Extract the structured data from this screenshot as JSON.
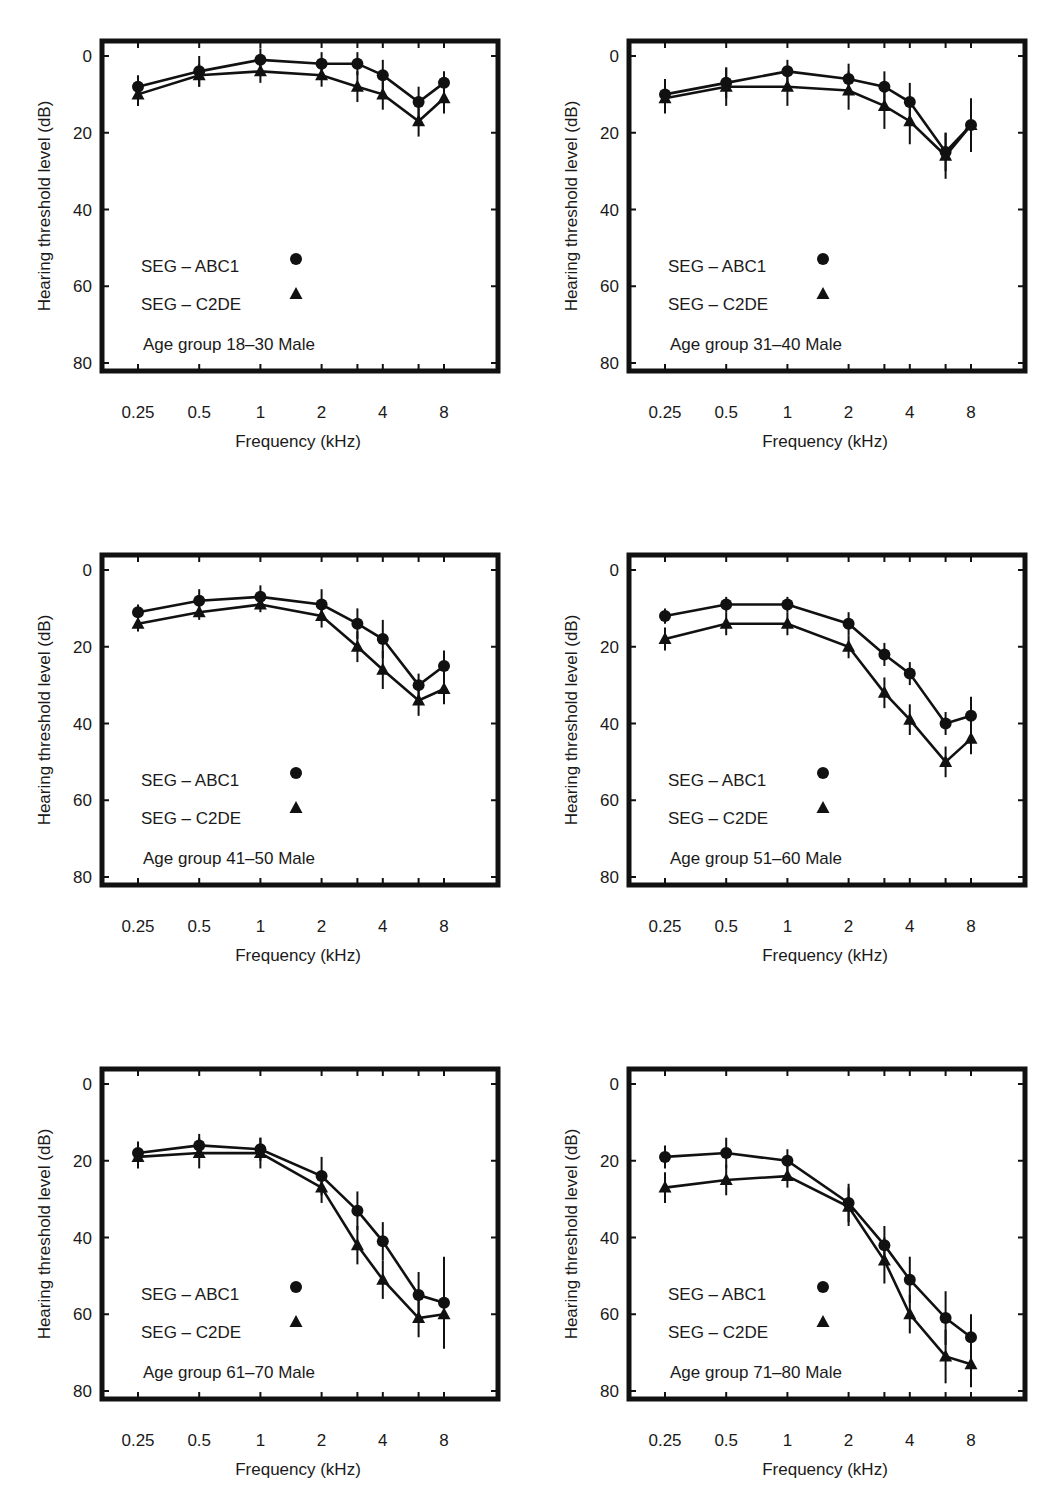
{
  "figure": {
    "layout": {
      "columns": 2,
      "rows": 3
    },
    "common": {
      "ylabel": "Hearing threshold level (dB)",
      "xlabel": "Frequency (kHz)",
      "y_ticks": [
        "0",
        "20",
        "40",
        "60",
        "80"
      ],
      "x_ticks": [
        "0.25",
        "0.5",
        "1",
        "2",
        "4",
        "8"
      ],
      "legend": [
        {
          "label": "SEG – ABC1",
          "marker": "circle"
        },
        {
          "label": "SEG – C2DE",
          "marker": "triangle"
        }
      ]
    }
  },
  "chart_data": [
    {
      "type": "line",
      "title": "Age group 18–30 Male",
      "xlabel": "Frequency (kHz)",
      "ylabel": "Hearing threshold level (dB)",
      "x": [
        0.25,
        0.5,
        1,
        2,
        3,
        4,
        6,
        8
      ],
      "x_tick_labels": [
        "0.25",
        "0.5",
        "1",
        "2",
        "4",
        "8"
      ],
      "ylim": [
        80,
        0
      ],
      "y_inverted": true,
      "series": [
        {
          "name": "SEG – ABC1",
          "marker": "circle",
          "values": [
            8,
            4,
            1,
            2,
            2,
            5,
            12,
            7
          ],
          "err": [
            3,
            4,
            3,
            3,
            3,
            4,
            4,
            3
          ]
        },
        {
          "name": "SEG – C2DE",
          "marker": "triangle",
          "values": [
            10,
            5,
            4,
            5,
            8,
            10,
            17,
            11
          ],
          "err": [
            3,
            3,
            3,
            3,
            4,
            4,
            4,
            4
          ]
        }
      ],
      "legend_position": "lower left",
      "grid": false
    },
    {
      "type": "line",
      "title": "Age group 31–40 Male",
      "xlabel": "Frequency (kHz)",
      "ylabel": "Hearing threshold level (dB)",
      "x": [
        0.25,
        0.5,
        1,
        2,
        3,
        4,
        6,
        8
      ],
      "x_tick_labels": [
        "0.25",
        "0.5",
        "1",
        "2",
        "4",
        "8"
      ],
      "ylim": [
        80,
        0
      ],
      "y_inverted": true,
      "series": [
        {
          "name": "SEG – ABC1",
          "marker": "circle",
          "values": [
            10,
            7,
            4,
            6,
            8,
            12,
            25,
            18
          ],
          "err": [
            4,
            4,
            3,
            4,
            4,
            5,
            5,
            7
          ]
        },
        {
          "name": "SEG – C2DE",
          "marker": "triangle",
          "values": [
            11,
            8,
            8,
            9,
            13,
            17,
            26,
            18
          ],
          "err": [
            4,
            5,
            5,
            5,
            6,
            6,
            6,
            6
          ]
        }
      ],
      "legend_position": "lower left",
      "grid": false
    },
    {
      "type": "line",
      "title": "Age group 41–50 Male",
      "xlabel": "Frequency (kHz)",
      "ylabel": "Hearing threshold level (dB)",
      "x": [
        0.25,
        0.5,
        1,
        2,
        3,
        4,
        6,
        8
      ],
      "x_tick_labels": [
        "0.25",
        "0.5",
        "1",
        "2",
        "4",
        "8"
      ],
      "ylim": [
        80,
        0
      ],
      "y_inverted": true,
      "series": [
        {
          "name": "SEG – ABC1",
          "marker": "circle",
          "values": [
            11,
            8,
            7,
            9,
            14,
            18,
            30,
            25
          ],
          "err": [
            2,
            3,
            3,
            4,
            4,
            5,
            3,
            4
          ]
        },
        {
          "name": "SEG – C2DE",
          "marker": "triangle",
          "values": [
            14,
            11,
            9,
            12,
            20,
            26,
            34,
            31
          ],
          "err": [
            2,
            2,
            2,
            3,
            4,
            5,
            4,
            4
          ]
        }
      ],
      "legend_position": "lower left",
      "grid": false
    },
    {
      "type": "line",
      "title": "Age group 51–60 Male",
      "xlabel": "Frequency (kHz)",
      "ylabel": "Hearing threshold level (dB)",
      "x": [
        0.25,
        0.5,
        1,
        2,
        3,
        4,
        6,
        8
      ],
      "x_tick_labels": [
        "0.25",
        "0.5",
        "1",
        "2",
        "4",
        "8"
      ],
      "ylim": [
        80,
        0
      ],
      "y_inverted": true,
      "series": [
        {
          "name": "SEG – ABC1",
          "marker": "circle",
          "values": [
            12,
            9,
            9,
            14,
            22,
            27,
            40,
            38
          ],
          "err": [
            2,
            2,
            2,
            3,
            3,
            3,
            3,
            5
          ]
        },
        {
          "name": "SEG – C2DE",
          "marker": "triangle",
          "values": [
            18,
            14,
            14,
            20,
            32,
            39,
            50,
            44
          ],
          "err": [
            3,
            3,
            3,
            3,
            4,
            4,
            4,
            4
          ]
        }
      ],
      "legend_position": "lower left",
      "grid": false
    },
    {
      "type": "line",
      "title": "Age group 61–70 Male",
      "xlabel": "Frequency (kHz)",
      "ylabel": "Hearing threshold level (dB)",
      "x": [
        0.25,
        0.5,
        1,
        2,
        3,
        4,
        6,
        8
      ],
      "x_tick_labels": [
        "0.25",
        "0.5",
        "1",
        "2",
        "4",
        "8"
      ],
      "ylim": [
        80,
        0
      ],
      "y_inverted": true,
      "series": [
        {
          "name": "SEG – ABC1",
          "marker": "circle",
          "values": [
            18,
            16,
            17,
            24,
            33,
            41,
            55,
            57
          ],
          "err": [
            3,
            3,
            3,
            5,
            5,
            5,
            6,
            12
          ]
        },
        {
          "name": "SEG – C2DE",
          "marker": "triangle",
          "values": [
            19,
            18,
            18,
            27,
            42,
            51,
            61,
            60
          ],
          "err": [
            3,
            4,
            4,
            4,
            5,
            5,
            5,
            8
          ]
        }
      ],
      "legend_position": "lower left",
      "grid": false
    },
    {
      "type": "line",
      "title": "Age group 71–80 Male",
      "xlabel": "Frequency (kHz)",
      "ylabel": "Hearing threshold level (dB)",
      "x": [
        0.25,
        0.5,
        1,
        2,
        3,
        4,
        6,
        8
      ],
      "x_tick_labels": [
        "0.25",
        "0.5",
        "1",
        "2",
        "4",
        "8"
      ],
      "ylim": [
        80,
        0
      ],
      "y_inverted": true,
      "series": [
        {
          "name": "SEG – ABC1",
          "marker": "circle",
          "values": [
            19,
            18,
            20,
            31,
            42,
            51,
            61,
            66
          ],
          "err": [
            3,
            4,
            3,
            5,
            5,
            6,
            7,
            6
          ]
        },
        {
          "name": "SEG – C2DE",
          "marker": "triangle",
          "values": [
            27,
            25,
            24,
            32,
            46,
            60,
            71,
            73
          ],
          "err": [
            4,
            4,
            3,
            5,
            6,
            5,
            7,
            6
          ]
        }
      ],
      "legend_position": "lower left",
      "grid": false
    }
  ]
}
